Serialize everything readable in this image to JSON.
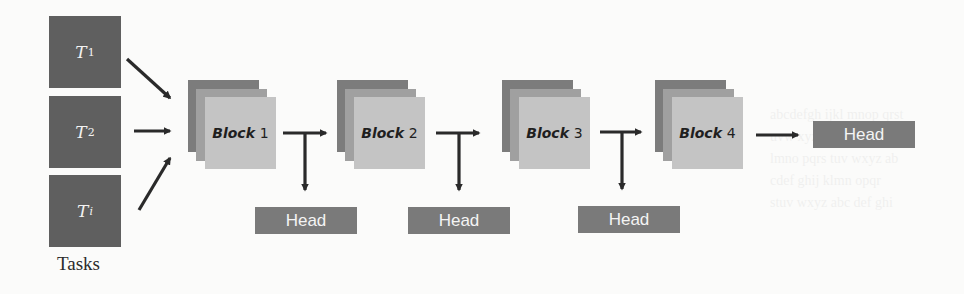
{
  "diagram": {
    "tasks": [
      {
        "symbol": "T",
        "subscript": "1"
      },
      {
        "symbol": "T",
        "subscript": "2"
      },
      {
        "symbol": "T",
        "subscript": "i"
      }
    ],
    "tasks_label": "Tasks",
    "blocks": [
      {
        "word": "Block",
        "number": "1"
      },
      {
        "word": "Block",
        "number": "2"
      },
      {
        "word": "Block",
        "number": "3"
      },
      {
        "word": "Block",
        "number": "4"
      }
    ],
    "heads": [
      {
        "label": "Head"
      },
      {
        "label": "Head"
      },
      {
        "label": "Head"
      },
      {
        "label": "Head"
      }
    ],
    "colors": {
      "task_fill": "#5f5f5f",
      "block_back": "#7c7c7c",
      "block_mid": "#a0a0a0",
      "block_front": "#c4c4c4",
      "head_fill": "#7a7a7a",
      "arrow": "#2a2a2a"
    }
  }
}
